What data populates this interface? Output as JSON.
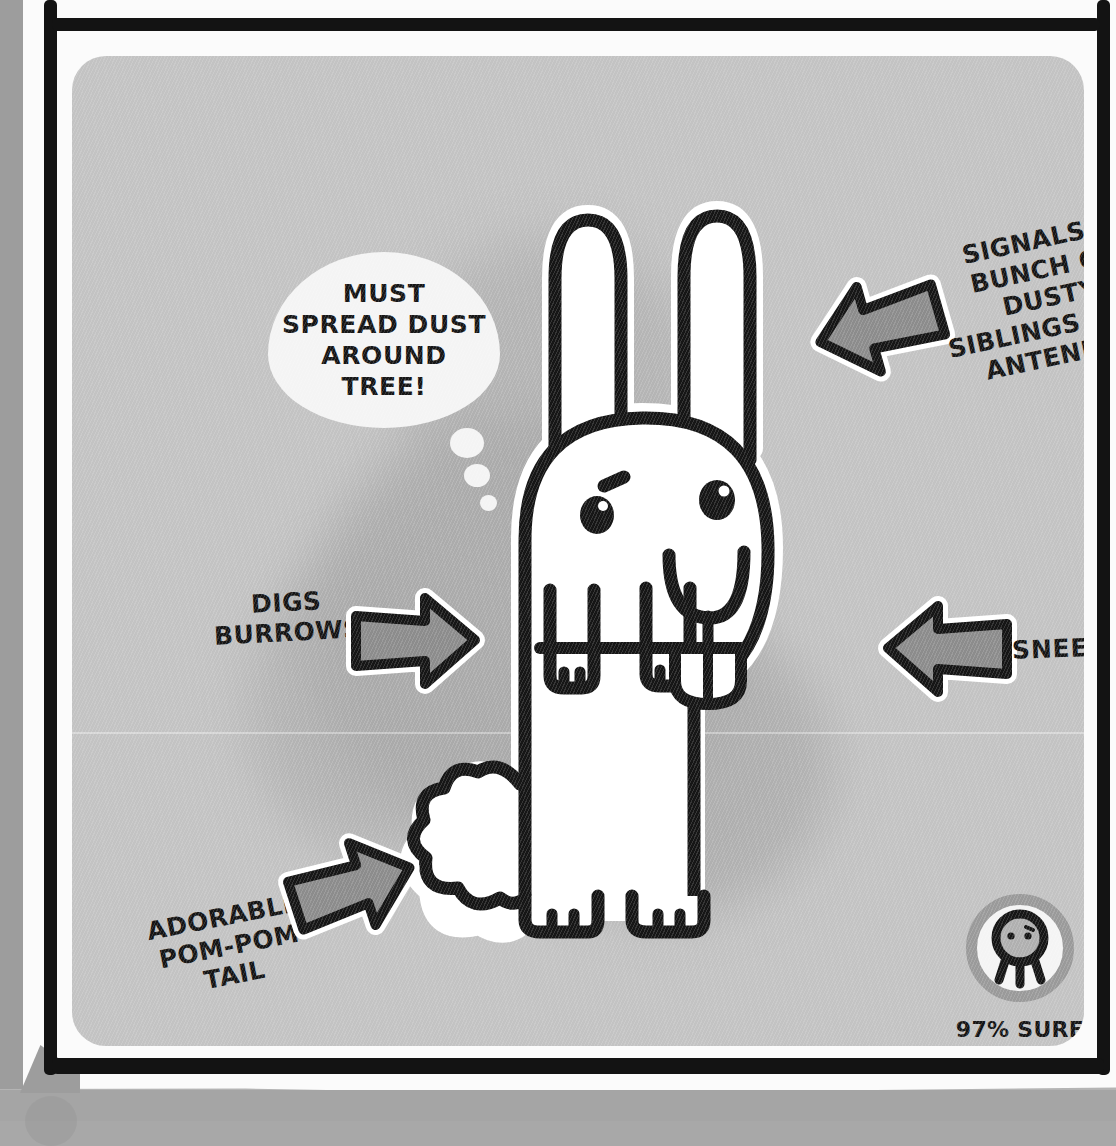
{
  "panel": {
    "background_color": "#c3c3c3",
    "frame_color": "#131313",
    "page_color": "#fbfbfb"
  },
  "thought_bubble": {
    "name": "rabbit-thought-bubble",
    "lines": [
      "MUST",
      "SPREAD DUST",
      "AROUND",
      "TREE!"
    ],
    "line1": "MUST",
    "line2": "SPREAD DUST",
    "line3": "AROUND",
    "line4": "TREE!"
  },
  "creature": {
    "name": "rabbit",
    "body_color": "#ffffff",
    "outline_color": "#161616"
  },
  "callouts": [
    {
      "id": "signals",
      "text": "SIGNALS A\nBUNCH OF\nDUSTY\nSIBLINGS WITH\nANTENNAE",
      "line1": "SIGNALS A",
      "line2": "BUNCH OF",
      "line3": "DUSTY",
      "line4": "SIBLINGS WITH",
      "line5": "ANTENNAE",
      "arrow_direction": "left",
      "points_at": "ears"
    },
    {
      "id": "digs",
      "text": "DIGS\nBURROWS",
      "line1": "DIGS",
      "line2": "BURROWS",
      "arrow_direction": "right",
      "points_at": "front-paws"
    },
    {
      "id": "sneezes",
      "text": "SNEEZES",
      "line1": "SNEEZES",
      "arrow_direction": "left",
      "points_at": "nose"
    },
    {
      "id": "pompom",
      "text": "ADORABLE\nPOM-POM\nTAIL",
      "line1": "ADORABLE",
      "line2": "POM-POM",
      "line3": "TAIL",
      "arrow_direction": "up-right",
      "points_at": "tail"
    }
  ],
  "badge": {
    "icon_name": "gary-creature-icon",
    "ring_color": "#9a9a9a",
    "line1": "97% SURE THEY'RE",
    "line2": "PALS WITH GARY",
    "percent": "97%"
  }
}
